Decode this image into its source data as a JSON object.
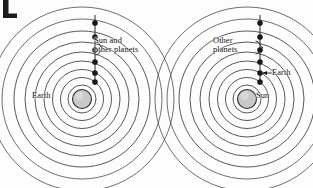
{
  "figure": {
    "width": 313,
    "height": 188,
    "background_color": "#fdfdfd",
    "ink_color": "#2b2b2b",
    "body_fill_color": "#c9c9c9",
    "corner_mark": "partial-dark-glyph"
  },
  "diagrams": [
    {
      "id": "geocentric",
      "name": "geocentric-model",
      "center_x": 82,
      "center_y": 99,
      "center_body_radius": 9.5,
      "ring_count": 9,
      "ring_radii": [
        14,
        21.5,
        29.5,
        38,
        47,
        57,
        68,
        80,
        92
      ],
      "dot_count": 6,
      "dot_radius": 2.6,
      "dot_offsets_y": [
        -76,
        -62,
        -49,
        -37,
        -26,
        -17
      ],
      "axis_x_offset": 13,
      "axis_top_y_offset": -84,
      "axis_bottom_y_offset": -14,
      "labels": {
        "center": "Earth",
        "orbiting": "Sun and\nother planets"
      }
    },
    {
      "id": "heliocentric",
      "name": "heliocentric-model",
      "center_x": 247,
      "center_y": 99,
      "center_body_radius": 9.5,
      "ring_count": 9,
      "ring_radii": [
        14,
        21.5,
        29.5,
        38,
        47,
        57,
        68,
        80,
        92
      ],
      "dot_count": 6,
      "dot_radius": 2.6,
      "dot_offsets_y": [
        -76,
        -62,
        -49,
        -37,
        -26,
        -17
      ],
      "axis_x_offset": 13,
      "axis_top_y_offset": -84,
      "axis_bottom_y_offset": -14,
      "labels": {
        "center": "Sun",
        "orbiting": "Other\nplanets",
        "highlighted_body": "Earth"
      }
    }
  ],
  "annotations": {
    "left_brace_label": "Sun and\nother planets",
    "right_brace_label": "Other\nplanets",
    "right_arrow_label": "Earth",
    "left_center_label": "Earth",
    "right_center_label": "Sun"
  }
}
